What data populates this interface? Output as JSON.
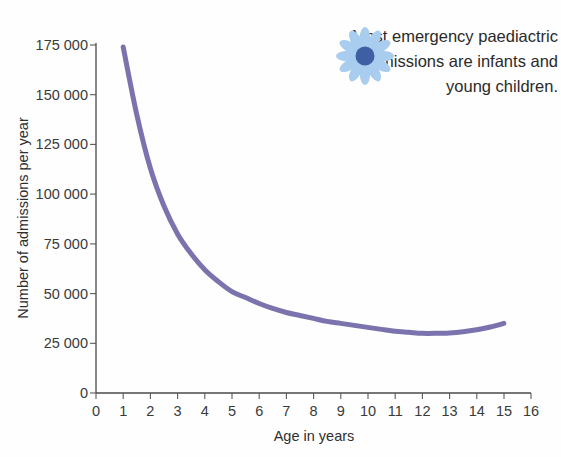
{
  "figure": {
    "background_color": "#fefefe",
    "text_color": "#2a2a2a"
  },
  "annotation": {
    "icon_name": "flower-icon",
    "icon_petal_color": "#a8cdee",
    "icon_center_color": "#3f5fa5",
    "text": "Most emergency paediactric admissions are infants and young children."
  },
  "chart_data": {
    "type": "line",
    "title": "",
    "xlabel": "Age in years",
    "ylabel": "Number of admissions per year",
    "xlim": [
      0,
      16
    ],
    "ylim": [
      0,
      175000
    ],
    "grid": false,
    "legend": false,
    "line_color": "#7b73ae",
    "line_width": 5,
    "x_ticks": [
      0,
      1,
      2,
      3,
      4,
      5,
      6,
      7,
      8,
      9,
      10,
      11,
      12,
      13,
      14,
      15,
      16
    ],
    "x_tick_labels": [
      "0",
      "1",
      "2",
      "3",
      "4",
      "5",
      "6",
      "7",
      "8",
      "9",
      "10",
      "11",
      "12",
      "13",
      "14",
      "15",
      "16"
    ],
    "y_ticks": [
      0,
      25000,
      50000,
      75000,
      100000,
      125000,
      150000,
      175000
    ],
    "y_tick_labels": [
      "0",
      "25 000",
      "50 000",
      "75 000",
      "100 000",
      "125 000",
      "150 000",
      "175 000"
    ],
    "x": [
      1,
      1.5,
      2,
      2.5,
      3,
      3.5,
      4,
      4.5,
      5,
      5.5,
      6,
      6.5,
      7,
      7.5,
      8,
      8.5,
      9,
      9.5,
      10,
      10.5,
      11,
      11.5,
      12,
      12.5,
      13,
      13.5,
      14,
      14.5,
      15
    ],
    "values": [
      174000,
      140000,
      113000,
      94000,
      80000,
      70000,
      62000,
      56000,
      51000,
      48000,
      45000,
      42500,
      40500,
      39000,
      37500,
      36000,
      35000,
      34000,
      33000,
      32000,
      31000,
      30500,
      30000,
      30000,
      30200,
      30800,
      31800,
      33200,
      35000
    ],
    "series": [
      {
        "name": "Emergency paediatric admissions",
        "values": [
          174000,
          140000,
          113000,
          94000,
          80000,
          70000,
          62000,
          56000,
          51000,
          48000,
          45000,
          42500,
          40500,
          39000,
          37500,
          36000,
          35000,
          34000,
          33000,
          32000,
          31000,
          30500,
          30000,
          30000,
          30200,
          30800,
          31800,
          33200,
          35000
        ]
      }
    ]
  }
}
